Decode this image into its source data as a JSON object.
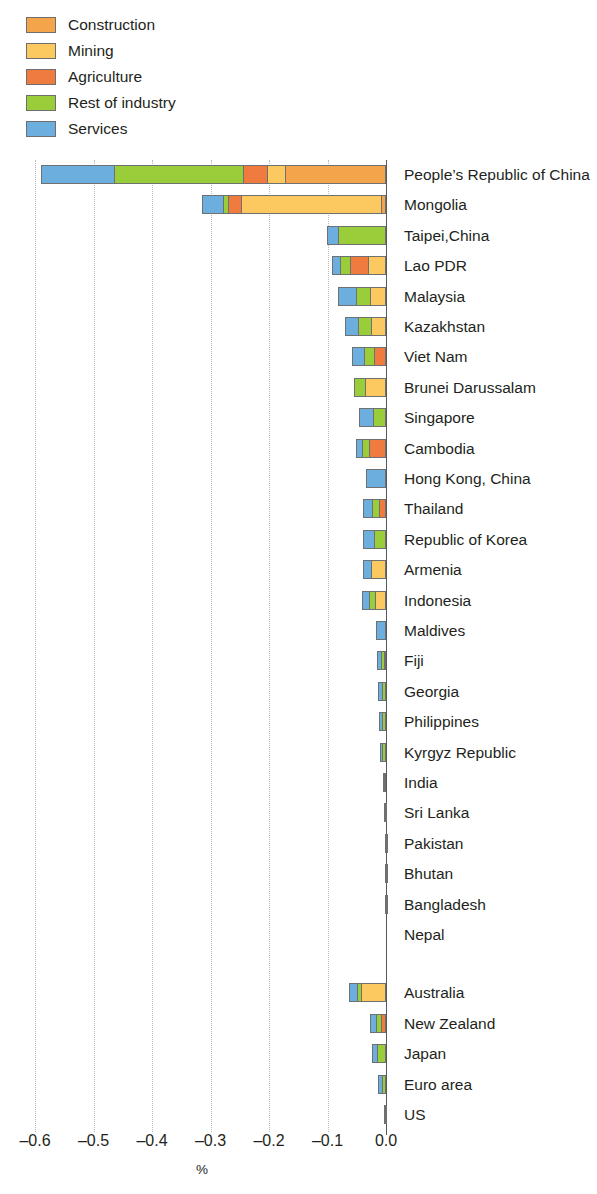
{
  "chart_data": {
    "type": "bar",
    "orientation": "horizontal",
    "stacked": true,
    "title": "",
    "subtitle": "",
    "xlabel": "%",
    "ylabel": "",
    "xlim": [
      -0.65,
      0.02
    ],
    "xticks": [
      -0.6,
      -0.5,
      -0.4,
      -0.3,
      -0.2,
      -0.1,
      0.0
    ],
    "xtick_labels": [
      "–0.6",
      "–0.5",
      "–0.4",
      "–0.3",
      "–0.2",
      "–0.1",
      "0.0"
    ],
    "grid": true,
    "legend_position": "top-left",
    "series": [
      {
        "name": "Construction",
        "color": "#F4A44A"
      },
      {
        "name": "Mining",
        "color": "#FBC95F"
      },
      {
        "name": "Agriculture",
        "color": "#F07B3F"
      },
      {
        "name": "Rest of industry",
        "color": "#9ACD3A"
      },
      {
        "name": "Services",
        "color": "#6CAFDE"
      }
    ],
    "categories": [
      "People’s Republic of China",
      "Mongolia",
      "Taipei,China",
      "Lao PDR",
      "Malaysia",
      "Kazakhstan",
      "Viet Nam",
      "Brunei Darussalam",
      "Singapore",
      "Cambodia",
      "Hong Kong, China",
      "Thailand",
      "Republic of Korea",
      "Armenia",
      "Indonesia",
      "Maldives",
      "Fiji",
      "Georgia",
      "Philippines",
      "Kyrgyz Republic",
      "India",
      "Sri Lanka",
      "Pakistan",
      "Bhutan",
      "Bangladesh",
      "Nepal",
      "Australia",
      "New Zealand",
      "Japan",
      "Euro area",
      "US"
    ],
    "gap_after_category": "Nepal",
    "values": {
      "Services": [
        -0.125,
        -0.0355,
        -0.019,
        -0.0145,
        -0.0295,
        -0.0235,
        -0.0195,
        0,
        -0.0255,
        -0.0105,
        -0.0335,
        -0.0145,
        -0.0185,
        -0.0145,
        -0.0115,
        -0.0175,
        -0.0075,
        -0.0065,
        -0.0055,
        -0.001,
        -0.0015,
        -0.0015,
        -0.0009,
        -0.0006,
        -0.0005,
        0,
        -0.0125,
        -0.0105,
        -0.0085,
        -0.0055,
        -0.0025
      ],
      "Rest of industry": [
        -0.2205,
        -0.0085,
        -0.082,
        -0.017,
        -0.0245,
        -0.0215,
        -0.0175,
        -0.0175,
        -0.0215,
        -0.0115,
        0,
        -0.0125,
        -0.0205,
        0,
        -0.0105,
        0,
        -0.006,
        -0.0065,
        -0.0065,
        -0.0085,
        -0.0035,
        -0.0015,
        -0.0009,
        -0.0009,
        -0.0005,
        0,
        -0.0075,
        -0.0085,
        -0.0155,
        -0.0075,
        -0.0015
      ],
      "Agriculture": [
        -0.041,
        -0.0225,
        0,
        -0.0305,
        0,
        0,
        -0.0205,
        0,
        0,
        -0.0295,
        0,
        -0.0115,
        0,
        0,
        0,
        0,
        -0.0025,
        0,
        0,
        0,
        0,
        0,
        0,
        0,
        0,
        0,
        0,
        -0.0085,
        0,
        0,
        0
      ],
      "Mining": [
        -0.031,
        -0.2395,
        0,
        -0.031,
        -0.0275,
        -0.0255,
        0,
        -0.0365,
        0,
        0,
        0,
        0,
        0,
        -0.0255,
        -0.0185,
        0,
        0,
        0,
        0,
        0,
        0,
        0,
        0,
        0,
        0,
        0,
        -0.0425,
        0,
        0,
        0,
        0
      ],
      "Construction": [
        -0.1725,
        -0.0085,
        0,
        0,
        0,
        0,
        0,
        0,
        0,
        0,
        0,
        0,
        0,
        0,
        0,
        0,
        0,
        0,
        0,
        0,
        0,
        0,
        0,
        0,
        0,
        0,
        0,
        0,
        0,
        0,
        0
      ]
    }
  },
  "legend": {
    "items": [
      {
        "label": "Construction",
        "color": "#F4A44A"
      },
      {
        "label": "Mining",
        "color": "#FBC95F"
      },
      {
        "label": "Agriculture",
        "color": "#F07B3F"
      },
      {
        "label": "Rest of industry",
        "color": "#9ACD3A"
      },
      {
        "label": "Services",
        "color": "#6CAFDE"
      }
    ]
  },
  "axis": {
    "title": "%",
    "ticks": [
      "–0.6",
      "–0.5",
      "–0.4",
      "–0.3",
      "–0.2",
      "–0.1",
      "0.0"
    ]
  }
}
